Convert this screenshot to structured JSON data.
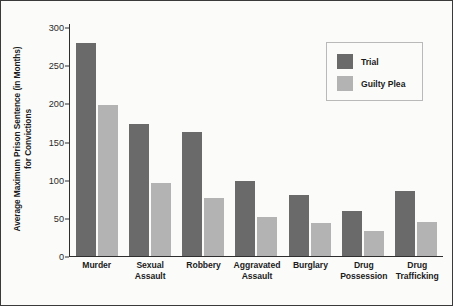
{
  "chart_data": {
    "type": "bar",
    "title": "",
    "xlabel": "",
    "ylabel_line1": "Average Maximum Prison Sentence (in Months)",
    "ylabel_line2": "for Convictions",
    "categories": [
      "Murder",
      "Sexual Assault",
      "Robbery",
      "Aggravated Assault",
      "Burglary",
      "Drug Possession",
      "Drug Trafficking"
    ],
    "category_lines": [
      [
        "Murder"
      ],
      [
        "Sexual",
        "Assault"
      ],
      [
        "Robbery"
      ],
      [
        "Aggravated",
        "Assault"
      ],
      [
        "Burglary"
      ],
      [
        "Drug",
        "Possession"
      ],
      [
        "Drug",
        "Trafficking"
      ]
    ],
    "series": [
      {
        "name": "Trial",
        "color": "#6a6a6a",
        "values": [
          278,
          173,
          162,
          98,
          80,
          58,
          85
        ]
      },
      {
        "name": "Guilty Plea",
        "color": "#b3b3b3",
        "values": [
          197,
          95,
          75,
          50,
          43,
          32,
          44
        ]
      }
    ],
    "ylim": [
      0,
      300
    ],
    "yticks": [
      0,
      50,
      100,
      150,
      200,
      250,
      300
    ],
    "ytick_labels": [
      "0",
      "50",
      "100",
      "150",
      "200",
      "250",
      "300"
    ],
    "grid": false,
    "legend_position": "top-right",
    "legend_entries": [
      "Trial",
      "Guilty Plea"
    ]
  },
  "colors": {
    "trial": "#6a6a6a",
    "guilty_plea": "#b3b3b3",
    "axis": "#2e2e2e",
    "background": "#fbfbfa",
    "frame": "#3a3a3a"
  }
}
